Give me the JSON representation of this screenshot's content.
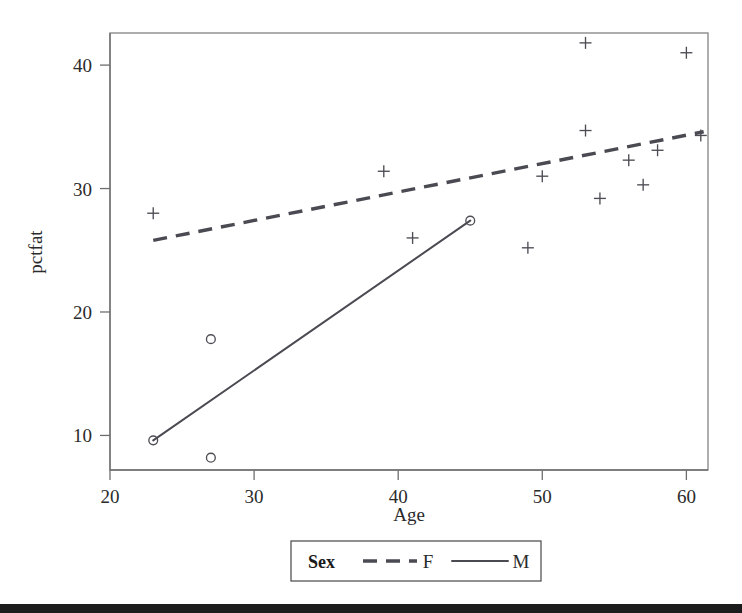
{
  "chart_data": {
    "type": "scatter",
    "title": "",
    "xlabel": "Age",
    "ylabel": "pctfat",
    "xlim": [
      20,
      61.5
    ],
    "ylim": [
      7.2,
      42.6
    ],
    "grid": false,
    "xticks": [
      20,
      30,
      40,
      50,
      60
    ],
    "yticks": [
      10,
      20,
      30,
      40
    ],
    "xtick_labels": [
      "20",
      "30",
      "40",
      "50",
      "60"
    ],
    "ytick_labels": [
      "10",
      "20",
      "30",
      "40"
    ],
    "legend": {
      "title": "Sex",
      "position": "bottom-center",
      "entries": [
        {
          "label": "F",
          "style": "dashed",
          "marker": "plus"
        },
        {
          "label": "M",
          "style": "solid",
          "marker": "circle"
        }
      ]
    },
    "series": [
      {
        "name": "F",
        "marker": "plus",
        "line_style": "dashed",
        "points": [
          {
            "x": 23,
            "y": 28.0
          },
          {
            "x": 39,
            "y": 31.4
          },
          {
            "x": 41,
            "y": 26.0
          },
          {
            "x": 49,
            "y": 25.2
          },
          {
            "x": 50,
            "y": 31.0
          },
          {
            "x": 53,
            "y": 41.8
          },
          {
            "x": 53,
            "y": 34.7
          },
          {
            "x": 54,
            "y": 29.2
          },
          {
            "x": 56,
            "y": 32.3
          },
          {
            "x": 57,
            "y": 30.3
          },
          {
            "x": 58,
            "y": 33.1
          },
          {
            "x": 60,
            "y": 41.0
          },
          {
            "x": 61,
            "y": 34.3
          }
        ],
        "fit_line": {
          "x0": 23,
          "y0": 25.8,
          "x1": 61.2,
          "y1": 34.6
        }
      },
      {
        "name": "M",
        "marker": "circle",
        "line_style": "solid",
        "points": [
          {
            "x": 23,
            "y": 9.6
          },
          {
            "x": 27,
            "y": 17.8
          },
          {
            "x": 27,
            "y": 8.2
          },
          {
            "x": 45,
            "y": 27.4
          }
        ],
        "fit_line": {
          "x0": 23,
          "y0": 9.6,
          "x1": 45,
          "y1": 27.4
        }
      }
    ]
  },
  "colors": {
    "line": "#4a4a52",
    "marker": "#4d4d55",
    "frame": "#8c8c8c",
    "axis": "#6e6e6e",
    "text": "#2b2b2b",
    "footer_bar": "#1c1c1c"
  },
  "footer": {
    "bar_visible": true
  }
}
